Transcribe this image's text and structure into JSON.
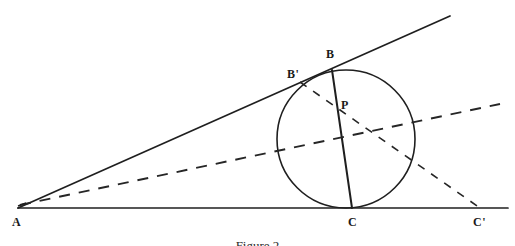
{
  "figure": {
    "caption": "Figure 2",
    "background_color": "#ffffff",
    "stroke_color": "#1f1f1f",
    "canvas": {
      "width": 515,
      "height": 246
    },
    "labels": {
      "a": "A",
      "b_prime": "B'",
      "b": "B",
      "p": "P",
      "c": "C",
      "c_prime": "C'"
    },
    "points": {
      "A": {
        "x": 18,
        "y": 208
      },
      "B_prime": {
        "x": 304,
        "y": 84
      },
      "B": {
        "x": 332,
        "y": 70
      },
      "P": {
        "x": 336,
        "y": 114
      },
      "C": {
        "x": 352,
        "y": 208
      },
      "C_prime": {
        "x": 480,
        "y": 208
      }
    },
    "circle": {
      "cx": 346,
      "cy": 139,
      "r": 69
    },
    "solid_lines": [
      {
        "name": "base-line-AC-extended",
        "x1": 18,
        "y1": 208,
        "x2": 508,
        "y2": 208
      },
      {
        "name": "tangent-line-AB-extended",
        "x1": 18,
        "y1": 208,
        "x2": 450,
        "y2": 16
      },
      {
        "name": "chord-B-C",
        "x1": 332,
        "y1": 70,
        "x2": 352,
        "y2": 208
      }
    ],
    "dashed_lines": [
      {
        "name": "dashed-line-A-through-circle",
        "x1": 20,
        "y1": 205,
        "x2": 500,
        "y2": 104
      },
      {
        "name": "dashed-line-Bprime-P-Cprime",
        "x1": 300,
        "y1": 82,
        "x2": 480,
        "y2": 208
      }
    ]
  }
}
